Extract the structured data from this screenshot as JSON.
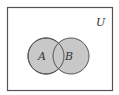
{
  "diagram": {
    "type": "venn",
    "universe": {
      "label": "U"
    },
    "sets": [
      {
        "label": "A",
        "shaded": true
      },
      {
        "label": "B",
        "shaded": true
      }
    ],
    "colors": {
      "fill": "#c8c8c8",
      "stroke": "#555555",
      "frame": "#555555",
      "background": "#ffffff"
    }
  }
}
